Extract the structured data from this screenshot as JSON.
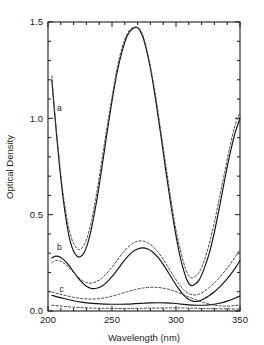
{
  "chart_data": {
    "type": "line",
    "title": "",
    "xlabel": "Wavelength (nm)",
    "ylabel": "Optical Density",
    "xlim": [
      200,
      350
    ],
    "ylim": [
      0.0,
      1.5
    ],
    "xticks": [
      200,
      250,
      300,
      350
    ],
    "xtick_labels": [
      "200",
      "250",
      "300",
      "350"
    ],
    "yticks": [
      0.0,
      0.5,
      1.0,
      1.5
    ],
    "ytick_labels": [
      "0.0",
      "0.5",
      "1.0",
      "1.5"
    ],
    "xminor_step": 10,
    "yminor_step": 0.1,
    "grid": false,
    "legend": "none",
    "annotations": [
      {
        "text": "a",
        "x": 207,
        "y": 1.04
      },
      {
        "text": "b",
        "x": 207,
        "y": 0.315
      },
      {
        "text": "c",
        "x": 209,
        "y": 0.1
      }
    ],
    "series": [
      {
        "name": "a-solid",
        "label": "a",
        "style": "solid",
        "x": [
          203,
          205,
          208,
          211,
          214,
          217,
          220,
          223,
          225,
          228,
          231,
          234,
          238,
          242,
          246,
          250,
          254,
          258,
          262,
          266,
          270,
          273,
          276,
          280,
          284,
          288,
          292,
          296,
          300,
          304,
          308,
          311,
          314,
          318,
          322,
          326,
          330,
          334,
          338,
          342,
          346,
          350
        ],
        "y": [
          1.2,
          1.04,
          0.82,
          0.63,
          0.48,
          0.37,
          0.31,
          0.283,
          0.281,
          0.3,
          0.35,
          0.43,
          0.57,
          0.74,
          0.92,
          1.09,
          1.24,
          1.35,
          1.43,
          1.465,
          1.47,
          1.44,
          1.38,
          1.26,
          1.1,
          0.92,
          0.73,
          0.55,
          0.39,
          0.26,
          0.17,
          0.135,
          0.135,
          0.16,
          0.22,
          0.3,
          0.41,
          0.54,
          0.68,
          0.81,
          0.92,
          1.0
        ]
      },
      {
        "name": "a-dotted",
        "label": "a",
        "style": "dotted",
        "x": [
          203,
          205,
          208,
          211,
          214,
          217,
          220,
          223,
          225,
          228,
          231,
          234,
          238,
          242,
          246,
          250,
          254,
          258,
          262,
          266,
          270,
          273,
          276,
          280,
          284,
          288,
          292,
          296,
          300,
          304,
          308,
          311,
          314,
          318,
          322,
          326,
          330,
          334,
          338,
          342,
          346,
          350
        ],
        "y": [
          1.22,
          1.05,
          0.84,
          0.65,
          0.51,
          0.41,
          0.35,
          0.322,
          0.32,
          0.34,
          0.39,
          0.47,
          0.61,
          0.78,
          0.95,
          1.11,
          1.26,
          1.37,
          1.44,
          1.47,
          1.472,
          1.45,
          1.39,
          1.27,
          1.12,
          0.94,
          0.76,
          0.58,
          0.42,
          0.3,
          0.21,
          0.175,
          0.175,
          0.2,
          0.26,
          0.35,
          0.46,
          0.59,
          0.72,
          0.85,
          0.96,
          1.03
        ]
      },
      {
        "name": "b-solid",
        "label": "b",
        "style": "solid",
        "x": [
          203,
          206,
          210,
          214,
          218,
          222,
          226,
          230,
          234,
          238,
          242,
          246,
          250,
          254,
          258,
          262,
          266,
          270,
          274,
          278,
          282,
          286,
          290,
          294,
          298,
          302,
          306,
          310,
          314,
          318,
          322,
          326,
          330,
          334,
          338,
          342,
          346,
          350
        ],
        "y": [
          0.275,
          0.285,
          0.278,
          0.255,
          0.222,
          0.185,
          0.152,
          0.128,
          0.117,
          0.118,
          0.129,
          0.15,
          0.178,
          0.212,
          0.248,
          0.281,
          0.307,
          0.322,
          0.328,
          0.322,
          0.305,
          0.278,
          0.242,
          0.2,
          0.157,
          0.116,
          0.082,
          0.06,
          0.05,
          0.052,
          0.063,
          0.08,
          0.1,
          0.124,
          0.152,
          0.184,
          0.22,
          0.262
        ]
      },
      {
        "name": "b-dotted",
        "label": "b",
        "style": "dotted",
        "x": [
          203,
          206,
          210,
          214,
          218,
          222,
          226,
          230,
          234,
          238,
          242,
          246,
          250,
          254,
          258,
          262,
          266,
          270,
          274,
          278,
          282,
          286,
          290,
          294,
          298,
          302,
          306,
          310,
          314,
          318,
          322,
          326,
          330,
          334,
          338,
          342,
          346,
          350
        ],
        "y": [
          0.25,
          0.262,
          0.258,
          0.24,
          0.214,
          0.186,
          0.162,
          0.148,
          0.145,
          0.153,
          0.17,
          0.196,
          0.228,
          0.263,
          0.298,
          0.328,
          0.35,
          0.362,
          0.363,
          0.354,
          0.334,
          0.305,
          0.268,
          0.226,
          0.183,
          0.143,
          0.11,
          0.09,
          0.083,
          0.088,
          0.102,
          0.122,
          0.146,
          0.174,
          0.206,
          0.24,
          0.278,
          0.32
        ]
      },
      {
        "name": "c-solid",
        "label": "c",
        "style": "solid",
        "x": [
          203,
          208,
          214,
          220,
          226,
          232,
          238,
          244,
          250,
          256,
          262,
          268,
          274,
          280,
          286,
          292,
          298,
          304,
          310,
          316,
          322,
          328,
          334,
          340,
          346,
          350
        ],
        "y": [
          0.082,
          0.072,
          0.062,
          0.053,
          0.046,
          0.041,
          0.038,
          0.036,
          0.035,
          0.035,
          0.036,
          0.038,
          0.04,
          0.042,
          0.043,
          0.042,
          0.04,
          0.036,
          0.032,
          0.03,
          0.03,
          0.033,
          0.04,
          0.051,
          0.066,
          0.078
        ]
      },
      {
        "name": "c-dotted",
        "label": "c",
        "style": "dotted",
        "x": [
          203,
          208,
          214,
          220,
          226,
          232,
          238,
          244,
          250,
          256,
          262,
          268,
          274,
          280,
          286,
          292,
          298,
          304,
          310,
          316,
          322,
          328,
          334,
          340,
          346,
          350
        ],
        "y": [
          0.098,
          0.09,
          0.08,
          0.071,
          0.065,
          0.062,
          0.063,
          0.068,
          0.077,
          0.088,
          0.1,
          0.111,
          0.119,
          0.123,
          0.122,
          0.116,
          0.105,
          0.09,
          0.073,
          0.057,
          0.043,
          0.033,
          0.027,
          0.025,
          0.028,
          0.032
        ]
      },
      {
        "name": "c-baseline",
        "label": "c",
        "style": "dotted",
        "x": [
          203,
          212,
          222,
          232,
          242,
          252,
          262,
          272,
          282,
          292,
          302,
          312,
          322,
          332,
          342,
          350
        ],
        "y": [
          0.03,
          0.024,
          0.019,
          0.016,
          0.014,
          0.013,
          0.013,
          0.014,
          0.015,
          0.016,
          0.016,
          0.015,
          0.013,
          0.012,
          0.011,
          0.01
        ]
      }
    ]
  },
  "axes": {
    "x_title": "Wavelength (nm)",
    "y_title": "Optical Density"
  }
}
